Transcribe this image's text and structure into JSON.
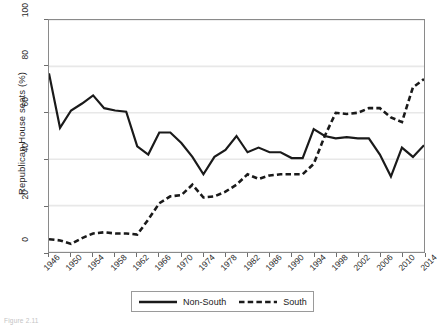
{
  "figure": {
    "caption": "Figure 2.11"
  },
  "axes": {
    "y_title": "Republican House seats (%)",
    "y_ticks": [
      "0",
      "20",
      "40",
      "60",
      "80",
      "100"
    ],
    "x_ticks": [
      "1946",
      "1950",
      "1954",
      "1958",
      "1962",
      "1966",
      "1970",
      "1974",
      "1978",
      "1982",
      "1986",
      "1990",
      "1994",
      "1998",
      "2002",
      "2006",
      "2010",
      "2014"
    ]
  },
  "legend": {
    "entries": [
      {
        "label": "Non-South",
        "style": "solid",
        "color": "#1a1a1a"
      },
      {
        "label": "South",
        "style": "dashed",
        "color": "#1a1a1a"
      }
    ]
  },
  "colors": {
    "ink": "#1a1a1a",
    "frame": "#8a8a8a",
    "gridline": "#e8e8e8",
    "background": "#ffffff"
  },
  "chart_data": {
    "type": "line",
    "title": "",
    "xlabel": "",
    "ylabel": "Republican House seats (%)",
    "xlim": [
      1946,
      2014
    ],
    "ylim": [
      0,
      100
    ],
    "grid": "horizontal",
    "legend_position": "bottom",
    "x": [
      1946,
      1948,
      1950,
      1952,
      1954,
      1956,
      1958,
      1960,
      1962,
      1964,
      1966,
      1968,
      1970,
      1972,
      1974,
      1976,
      1978,
      1980,
      1982,
      1984,
      1986,
      1988,
      1990,
      1992,
      1994,
      1996,
      1998,
      2000,
      2002,
      2004,
      2006,
      2008,
      2010,
      2012,
      2014
    ],
    "series": [
      {
        "name": "Non-South",
        "style": "solid",
        "values": [
          77,
          53.5,
          61,
          64,
          67.5,
          62,
          61,
          60.5,
          45.5,
          42,
          51.5,
          51.5,
          47,
          41,
          33.5,
          41,
          44,
          50,
          43,
          45,
          43,
          43,
          40.5,
          40.5,
          53,
          50,
          49,
          49.5,
          49,
          49,
          42,
          32.5,
          45,
          41,
          46
        ]
      },
      {
        "name": "South",
        "style": "dashed",
        "values": [
          5.5,
          5,
          3.5,
          6,
          8,
          8.5,
          8,
          8,
          7.5,
          14,
          21,
          24,
          24.5,
          29,
          23.5,
          24,
          26,
          29,
          33.5,
          31.5,
          33,
          33.5,
          33.5,
          33.5,
          38,
          50,
          60,
          59.5,
          60,
          62,
          62,
          58,
          56,
          71,
          74.5
        ]
      }
    ]
  }
}
